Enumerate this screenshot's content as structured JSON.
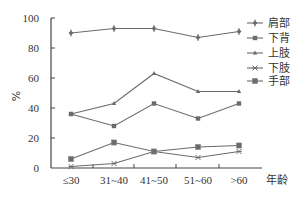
{
  "chart_data": {
    "type": "line",
    "title": "",
    "xlabel": "年龄",
    "ylabel": "%",
    "ylim": [
      0,
      100
    ],
    "yticks": [
      0,
      20,
      40,
      60,
      80,
      100
    ],
    "grid": false,
    "legend_position": "right",
    "categories": [
      "≤30",
      "31~40",
      "41~50",
      "51~60",
      ">60"
    ],
    "series": [
      {
        "name": "肩部",
        "marker": "diamond",
        "values": [
          90,
          93,
          93,
          87,
          91
        ]
      },
      {
        "name": "下背",
        "marker": "square",
        "values": [
          36,
          28,
          43,
          33,
          43
        ]
      },
      {
        "name": "上肢",
        "marker": "triangle",
        "values": [
          36,
          43,
          63,
          51,
          51
        ]
      },
      {
        "name": "下肢",
        "marker": "x",
        "values": [
          1,
          3,
          11,
          7,
          11
        ]
      },
      {
        "name": "手部",
        "marker": "square-filled",
        "values": [
          6,
          17,
          11,
          14,
          15
        ]
      }
    ]
  },
  "style": {
    "line_color": "#6b6b6b",
    "axis_color": "#444444",
    "text_color": "#333333"
  }
}
